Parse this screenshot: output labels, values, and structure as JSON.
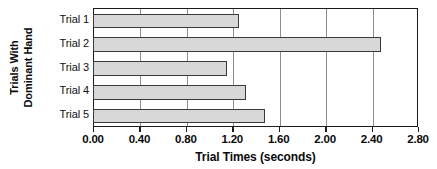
{
  "chart_data": {
    "type": "bar",
    "orientation": "horizontal",
    "title": "",
    "xlabel": "Trial Times (seconds)",
    "ylabel": "Trials With Dominant Hand",
    "ylabel_line1": "Trials With",
    "ylabel_line2": "Dominant Hand",
    "categories": [
      "Trial 1",
      "Trial 2",
      "Trial 3",
      "Trial 4",
      "Trial 5"
    ],
    "values": [
      1.25,
      2.47,
      1.15,
      1.31,
      1.47
    ],
    "xlim": [
      0.0,
      2.8
    ],
    "ylim": null,
    "xticks": [
      0.0,
      0.4,
      0.8,
      1.2,
      1.6,
      2.0,
      2.4,
      2.8
    ],
    "xtick_labels": [
      "0.00",
      "0.40",
      "0.80",
      "1.20",
      "1.60",
      "2.00",
      "2.40",
      "2.80"
    ],
    "grid": "vertical",
    "legend": null,
    "bar_fill_color": "#d8d8d8",
    "bar_border_color": "#3a3a3a",
    "gridline_color": "#8e8e8e",
    "axis_color": "#1b1b1b",
    "text_color": "#0a0a0a"
  }
}
